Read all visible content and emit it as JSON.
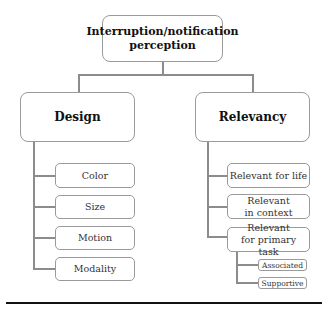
{
  "root": {
    "label": "Interruption/notification perception"
  },
  "categories": [
    {
      "label": "Design",
      "children": [
        {
          "label": "Color"
        },
        {
          "label": "Size"
        },
        {
          "label": "Motion"
        },
        {
          "label": "Modality"
        }
      ]
    },
    {
      "label": "Relevancy",
      "children": [
        {
          "label": "Relevant for life"
        },
        {
          "label": "Relevant in context"
        },
        {
          "label": "Relevant for primary task",
          "children": [
            {
              "label": "Associated"
            },
            {
              "label": "Supportive"
            }
          ]
        }
      ]
    }
  ]
}
